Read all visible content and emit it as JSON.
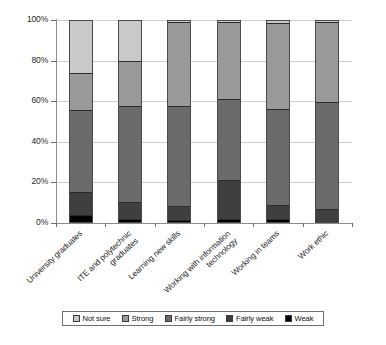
{
  "chart_data": {
    "type": "bar",
    "subtype": "stacked-100-percent",
    "title": "",
    "xlabel": "",
    "ylabel": "",
    "ylim": [
      0,
      100
    ],
    "ytick_labels": [
      "0%",
      "20%",
      "40%",
      "60%",
      "80%",
      "100%"
    ],
    "ytick_values": [
      0,
      20,
      40,
      60,
      80,
      100
    ],
    "grid": true,
    "legend_position": "bottom",
    "categories": [
      "University graduates",
      "ITE and polytechnic\ngraduates",
      "Learning new skills",
      "Working with information\ntechnology",
      "Working in teams",
      "Work ethic"
    ],
    "series": [
      {
        "name": "Weak",
        "color": "#000000",
        "values": [
          3.5,
          1.5,
          1.0,
          1.5,
          1.0,
          0.0
        ]
      },
      {
        "name": "Fairly weak",
        "color": "#3f3f3f",
        "values": [
          11.5,
          8.5,
          7.0,
          19.0,
          7.0,
          6.5
        ]
      },
      {
        "name": "Fairly strong",
        "color": "#6b6b6b",
        "values": [
          40.0,
          47.0,
          49.0,
          40.0,
          47.0,
          52.5
        ]
      },
      {
        "name": "Strong",
        "color": "#9a9a9a",
        "values": [
          18.5,
          22.5,
          41.5,
          38.0,
          42.5,
          39.5
        ]
      },
      {
        "name": "Not sure",
        "color": "#c9c9c9",
        "values": [
          26.5,
          20.5,
          1.5,
          1.5,
          2.0,
          1.5
        ]
      }
    ]
  },
  "legend": {
    "items": [
      {
        "label": "Not sure",
        "color": "#c9c9c9"
      },
      {
        "label": "Strong",
        "color": "#9a9a9a"
      },
      {
        "label": "Fairly strong",
        "color": "#6b6b6b"
      },
      {
        "label": "Fairly weak",
        "color": "#3f3f3f"
      },
      {
        "label": "Weak",
        "color": "#000000"
      }
    ]
  }
}
